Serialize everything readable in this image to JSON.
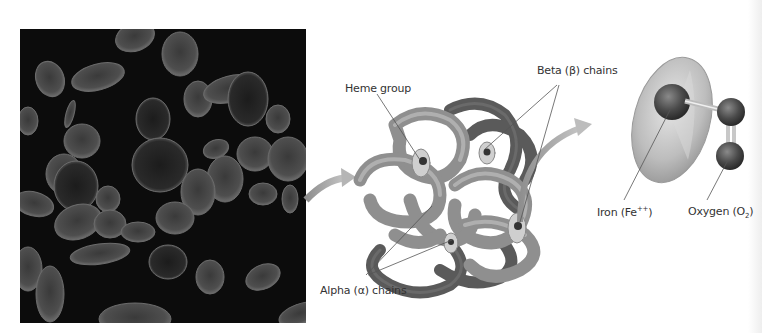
{
  "figure": {
    "panels": [
      {
        "id": "blood-cells-photo",
        "description": "Red blood cells on dark background"
      },
      {
        "id": "hemoglobin-molecule",
        "description": "Hemoglobin protein ribbon model"
      },
      {
        "id": "heme-group-detail",
        "description": "Heme disk with iron bound to oxygen"
      }
    ],
    "labels": {
      "heme_group": "Heme group",
      "beta_chains": "Beta (β) chains",
      "alpha_chains": "Alpha (α) chains",
      "iron_prefix": "Iron (Fe",
      "iron_sup": "++",
      "iron_suffix": ")",
      "oxygen_prefix": "Oxygen (O",
      "oxygen_sub": "2",
      "oxygen_suffix": ")"
    },
    "colors": {
      "photo_background": "#0c0c0c",
      "cell": "#5a5a5a",
      "arrow": "#a9a9a9",
      "chain_light": "#9a9a9a",
      "chain_dark": "#555555",
      "leader_line": "#555555",
      "label_text": "#333333"
    }
  }
}
